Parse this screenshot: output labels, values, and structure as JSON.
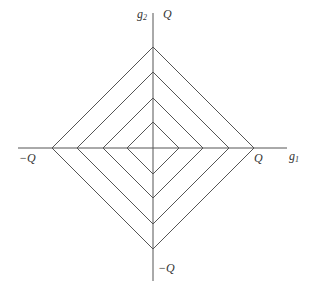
{
  "diagram": {
    "type": "nested-diamonds",
    "colors": {
      "line": "#555555",
      "text": "#333333",
      "background": "#ffffff"
    },
    "center": {
      "x": 153,
      "y": 148
    },
    "diamond_half_sizes": [
      26,
      50,
      76,
      101
    ],
    "axes": {
      "horizontal": {
        "x1": 18,
        "x2": 287,
        "y": 148,
        "label_base": "g",
        "label_sub": "1"
      },
      "vertical": {
        "x": 153,
        "y1": 13,
        "y2": 281,
        "label_base": "g",
        "label_sub": "2"
      }
    },
    "labels": {
      "top": "Q",
      "bottom": "−Q",
      "left": "−Q",
      "right": "Q"
    }
  }
}
